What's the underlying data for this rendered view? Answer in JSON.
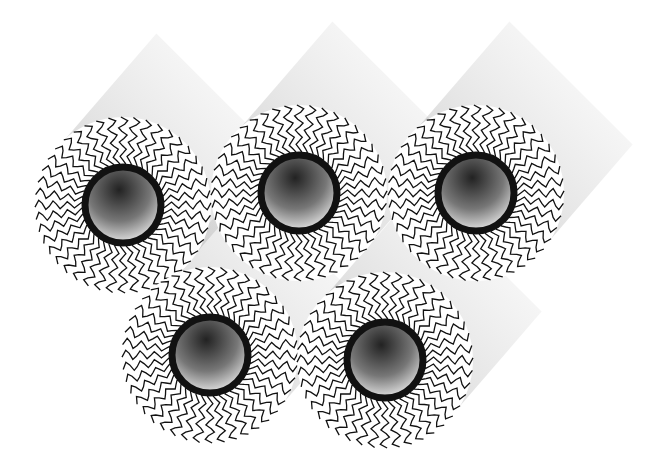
{
  "diagram": {
    "colors": {
      "ink": "#111111",
      "background": "#ffffff"
    },
    "cylinders": [
      {
        "cx": 123,
        "cy": 205,
        "r_outer": 88,
        "r_core": 38
      },
      {
        "cx": 299,
        "cy": 193,
        "r_outer": 88,
        "r_core": 38
      },
      {
        "cx": 476,
        "cy": 193,
        "r_outer": 88,
        "r_core": 38
      },
      {
        "cx": 210,
        "cy": 355,
        "r_outer": 88,
        "r_core": 38
      },
      {
        "cx": 385,
        "cy": 360,
        "r_outer": 88,
        "r_core": 38
      }
    ],
    "tail_count": 44,
    "extrusion": {
      "dx": 95,
      "dy": -110
    }
  }
}
